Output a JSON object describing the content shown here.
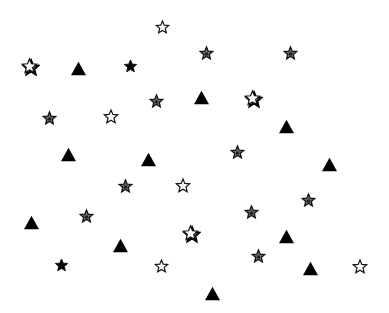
{
  "canvas": {
    "width": 389,
    "height": 313,
    "background": "#ffffff"
  },
  "colors": {
    "black": "#000000",
    "gray_fill": "#6e6e6e",
    "outline_fill": "#ffffff",
    "stroke": "#111111"
  },
  "shapes": [
    {
      "type": "star",
      "style": "outline",
      "x": 162,
      "y": 27,
      "size": 13
    },
    {
      "type": "star",
      "style": "gray",
      "x": 206,
      "y": 53,
      "size": 13
    },
    {
      "type": "star",
      "style": "gray",
      "x": 290,
      "y": 53,
      "size": 13
    },
    {
      "type": "star",
      "style": "outline-shadow",
      "x": 29,
      "y": 66,
      "size": 15
    },
    {
      "type": "star",
      "style": "black",
      "x": 130,
      "y": 66,
      "size": 13
    },
    {
      "type": "triangle",
      "style": "black",
      "x": 78,
      "y": 68,
      "size": 15
    },
    {
      "type": "star",
      "style": "gray",
      "x": 156,
      "y": 101,
      "size": 13
    },
    {
      "type": "triangle",
      "style": "black",
      "x": 201,
      "y": 97,
      "size": 15
    },
    {
      "type": "star",
      "style": "outline-shadow",
      "x": 252,
      "y": 98,
      "size": 15
    },
    {
      "type": "star",
      "style": "gray",
      "x": 49,
      "y": 118,
      "size": 13
    },
    {
      "type": "star",
      "style": "outline",
      "x": 111,
      "y": 117,
      "size": 14
    },
    {
      "type": "triangle",
      "style": "black",
      "x": 286,
      "y": 126,
      "size": 15
    },
    {
      "type": "star",
      "style": "gray",
      "x": 237,
      "y": 152,
      "size": 13
    },
    {
      "type": "triangle",
      "style": "black",
      "x": 68,
      "y": 154,
      "size": 15
    },
    {
      "type": "triangle",
      "style": "black",
      "x": 148,
      "y": 159,
      "size": 15
    },
    {
      "type": "triangle",
      "style": "black",
      "x": 329,
      "y": 164,
      "size": 15
    },
    {
      "type": "star",
      "style": "gray",
      "x": 125,
      "y": 186,
      "size": 13
    },
    {
      "type": "star",
      "style": "outline",
      "x": 183,
      "y": 186,
      "size": 14
    },
    {
      "type": "star",
      "style": "gray",
      "x": 308,
      "y": 200,
      "size": 13
    },
    {
      "type": "star",
      "style": "gray",
      "x": 86,
      "y": 216,
      "size": 13
    },
    {
      "type": "star",
      "style": "gray",
      "x": 251,
      "y": 212,
      "size": 13
    },
    {
      "type": "triangle",
      "style": "black",
      "x": 31,
      "y": 222,
      "size": 15
    },
    {
      "type": "star",
      "style": "outline-shadow",
      "x": 190,
      "y": 233,
      "size": 15
    },
    {
      "type": "triangle",
      "style": "black",
      "x": 286,
      "y": 236,
      "size": 15
    },
    {
      "type": "triangle",
      "style": "black",
      "x": 120,
      "y": 245,
      "size": 15
    },
    {
      "type": "star",
      "style": "gray",
      "x": 258,
      "y": 256,
      "size": 13
    },
    {
      "type": "star",
      "style": "black",
      "x": 61,
      "y": 265,
      "size": 13
    },
    {
      "type": "star",
      "style": "outline",
      "x": 161,
      "y": 266,
      "size": 13
    },
    {
      "type": "triangle",
      "style": "black",
      "x": 310,
      "y": 268,
      "size": 15
    },
    {
      "type": "star",
      "style": "outline",
      "x": 360,
      "y": 267,
      "size": 14
    },
    {
      "type": "triangle",
      "style": "black",
      "x": 212,
      "y": 293,
      "size": 15
    }
  ]
}
